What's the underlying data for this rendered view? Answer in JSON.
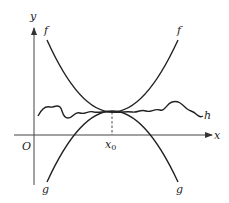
{
  "figure": {
    "axes": {
      "x_label": "x",
      "y_label": "y",
      "origin_label": "O"
    },
    "tangent_point": {
      "label": "x",
      "subscript": "0"
    },
    "curves": {
      "f_left_label": "f",
      "f_right_label": "f",
      "g_left_label": "g",
      "g_right_label": "g",
      "h_label": "h"
    },
    "colors": {
      "stroke": "#222222",
      "background": "#ffffff"
    }
  }
}
